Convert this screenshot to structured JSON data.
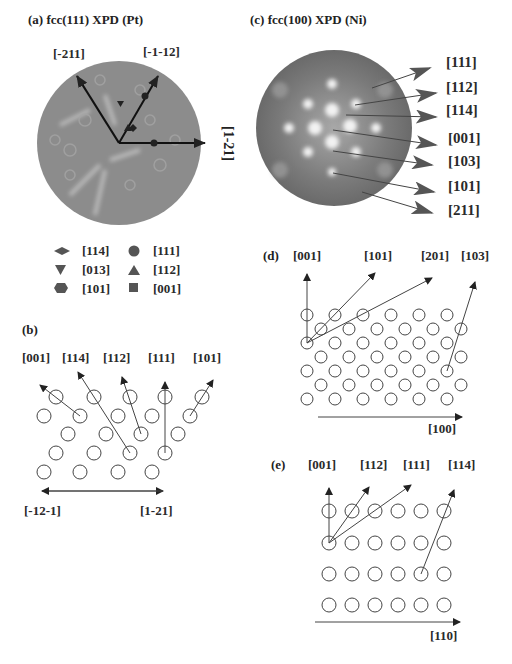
{
  "panels": {
    "a": {
      "title": "(a) fcc(111) XPD (Pt)",
      "axes": [
        "[-211]",
        "[-1-12]",
        "[1-21]"
      ]
    },
    "legend": {
      "items": [
        {
          "symbol": "diamond",
          "label": "[114]"
        },
        {
          "symbol": "circle",
          "label": "[111]"
        },
        {
          "symbol": "triangle-down",
          "label": "[013]"
        },
        {
          "symbol": "triangle-up",
          "label": "[112]"
        },
        {
          "symbol": "hexagon",
          "label": "[101]"
        },
        {
          "symbol": "square",
          "label": "[001]"
        }
      ]
    },
    "b": {
      "title": "(b)",
      "directions": [
        "[001]",
        "[114]",
        "[112]",
        "[111]",
        "[101]"
      ],
      "axis_left": "[-12-1]",
      "axis_right": "[1-21]"
    },
    "c": {
      "title": "(c) fcc(100) XPD (Ni)",
      "directions": [
        "[111]",
        "[112]",
        "[114]",
        "[001]",
        "[103]",
        "[101]",
        "[211]"
      ]
    },
    "d": {
      "title": "(d)",
      "directions": [
        "[001]",
        "[101]",
        "[201]",
        "[103]"
      ],
      "axis": "[100]"
    },
    "e": {
      "title": "(e)",
      "directions": [
        "[001]",
        "[112]",
        "[111]",
        "[114]"
      ],
      "axis": "[110]"
    }
  },
  "colors": {
    "pattern_gray": "#8a8a8a",
    "ink": "#222222",
    "symbol": "#555555"
  }
}
